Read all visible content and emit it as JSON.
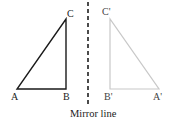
{
  "diagram": {
    "original": {
      "labels": {
        "a": "A",
        "b": "B",
        "c": "C"
      },
      "color": "#1a1a1a"
    },
    "image": {
      "labels": {
        "a": "A'",
        "b": "B'",
        "c": "C'"
      },
      "color": "#c8c8c8"
    },
    "mirror": {
      "caption": "Mirror line",
      "color": "#111111"
    }
  }
}
